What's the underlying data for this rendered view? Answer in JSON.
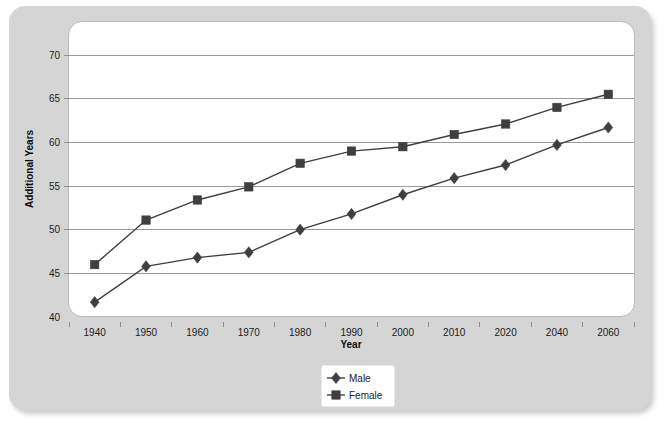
{
  "chart_data": {
    "type": "line",
    "title": "",
    "xlabel": "Year",
    "ylabel": "Additional Years",
    "categories": [
      "1940",
      "1950",
      "1960",
      "1970",
      "1980",
      "1990",
      "2000",
      "2010",
      "2020",
      "2040",
      "2060"
    ],
    "series": [
      {
        "name": "Male",
        "marker": "diamond",
        "color": "#3f3f3f",
        "values": [
          41.7,
          45.8,
          46.8,
          47.4,
          50.0,
          51.8,
          54.0,
          55.9,
          57.4,
          59.7,
          61.7
        ]
      },
      {
        "name": "Female",
        "marker": "square",
        "color": "#3f3f3f",
        "values": [
          46.0,
          51.1,
          53.4,
          54.9,
          57.6,
          59.0,
          59.5,
          60.9,
          62.1,
          64.0,
          65.5
        ]
      }
    ],
    "ylim": [
      40,
      70
    ],
    "yticks": [
      "40",
      "45",
      "50",
      "55",
      "60",
      "65",
      "70"
    ],
    "grid": true,
    "legend_position": "bottom-center",
    "plot_background": "#ffffff",
    "panel_background": "#d5d5d5",
    "gridline_color": "#9a9a9a"
  }
}
